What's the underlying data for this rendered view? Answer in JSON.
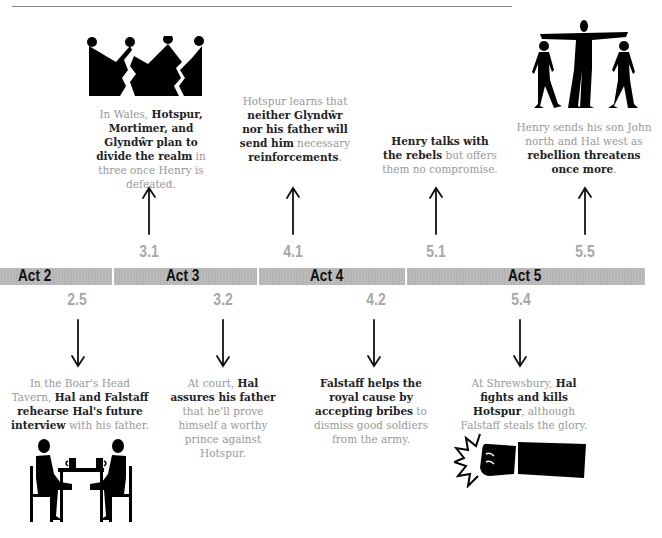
{
  "header": {
    "running_head": "THE BOAR · CHARACTERS · TIMELINE"
  },
  "timeline": {
    "acts": [
      {
        "label": "Act 2"
      },
      {
        "label": "Act 3"
      },
      {
        "label": "Act 4"
      },
      {
        "label": "Act 5"
      }
    ],
    "above": [
      {
        "scene": "3.1",
        "illustration": "broken-crown-icon",
        "caption_parts": [
          {
            "text": "In Wales, ",
            "bold": false
          },
          {
            "text": "Hotspur, Mortimer, and Glyndŵr plan to divide the realm",
            "bold": true
          },
          {
            "text": " in three once Henry is defeated.",
            "bold": false
          }
        ]
      },
      {
        "scene": "4.1",
        "illustration": "",
        "caption_parts": [
          {
            "text": "Hotspur learns that ",
            "bold": false
          },
          {
            "text": "neither Glyndŵr nor his father will send him",
            "bold": true
          },
          {
            "text": " necessary ",
            "bold": false
          },
          {
            "text": "reinforcements",
            "bold": true
          },
          {
            "text": ".",
            "bold": false
          }
        ]
      },
      {
        "scene": "5.1",
        "illustration": "",
        "caption_parts": [
          {
            "text": "Henry talks with the rebels",
            "bold": true
          },
          {
            "text": " but offers them no compromise.",
            "bold": false
          }
        ]
      },
      {
        "scene": "5.5",
        "illustration": "three-figures-pointing-icon",
        "caption_parts": [
          {
            "text": "Henry sends his son John north and Hal west as ",
            "bold": false
          },
          {
            "text": "rebellion threatens once more",
            "bold": true
          },
          {
            "text": ".",
            "bold": false
          }
        ]
      }
    ],
    "below": [
      {
        "scene": "2.5",
        "illustration": "tavern-table-icon",
        "caption_parts": [
          {
            "text": "In the Boar's Head Tavern, ",
            "bold": false
          },
          {
            "text": "Hal and Falstaff rehearse Hal's future interview",
            "bold": true
          },
          {
            "text": " with his father.",
            "bold": false
          }
        ]
      },
      {
        "scene": "3.2",
        "illustration": "",
        "caption_parts": [
          {
            "text": "At court, ",
            "bold": false
          },
          {
            "text": "Hal assures his father",
            "bold": true
          },
          {
            "text": " that he'll prove himself a worthy prince against Hotspur.",
            "bold": false
          }
        ]
      },
      {
        "scene": "4.2",
        "illustration": "",
        "caption_parts": [
          {
            "text": "Falstaff helps the royal cause by accepting bribes",
            "bold": true
          },
          {
            "text": " to dismiss good soldiers from the army.",
            "bold": false
          }
        ]
      },
      {
        "scene": "5.4",
        "illustration": "punching-fist-icon",
        "caption_parts": [
          {
            "text": "At Shrewsbury, ",
            "bold": false
          },
          {
            "text": "Hal fights and kills Hotspur",
            "bold": true
          },
          {
            "text": ", although Falstaff steals the glory.",
            "bold": false
          }
        ]
      }
    ]
  }
}
